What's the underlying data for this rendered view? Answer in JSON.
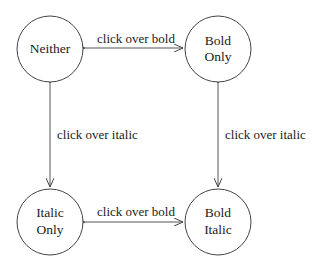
{
  "diagram": {
    "type": "state-diagram",
    "nodes": [
      {
        "id": "neither",
        "lines": [
          "Neither"
        ]
      },
      {
        "id": "bold-only",
        "lines": [
          "Bold",
          "Only"
        ]
      },
      {
        "id": "italic-only",
        "lines": [
          "Italic",
          "Only"
        ]
      },
      {
        "id": "bold-italic",
        "lines": [
          "Bold",
          "Italic"
        ]
      }
    ],
    "edges": [
      {
        "from": "neither",
        "to": "bold-only",
        "label": "click over bold",
        "bidirectional": true
      },
      {
        "from": "italic-only",
        "to": "bold-italic",
        "label": "click over bold",
        "bidirectional": true
      },
      {
        "from": "neither",
        "to": "italic-only",
        "label": "click over italic",
        "bidirectional": true
      },
      {
        "from": "bold-only",
        "to": "bold-italic",
        "label": "click over italic",
        "bidirectional": true
      }
    ]
  }
}
